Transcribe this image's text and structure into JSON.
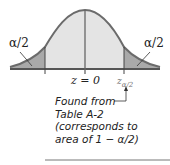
{
  "figure": {
    "left_tail_label": "α/2",
    "right_tail_label": "α/2",
    "center_label": "z = 0",
    "critical_label_main": "z",
    "critical_label_sub": "α/2",
    "note_lines": [
      "Found from",
      "Table A-2",
      "(corresponds to",
      "area of 1 − α/2)"
    ]
  },
  "colors": {
    "curve": "#6b6b6b",
    "center_fill": "#e4e4e4",
    "tail_fill": "#a9a9a9",
    "axis": "#555555",
    "rule": "#777777"
  }
}
